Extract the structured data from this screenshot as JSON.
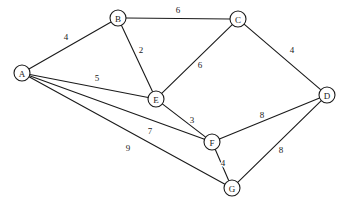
{
  "chart_data": {
    "type": "diagram",
    "title": "",
    "graph_kind": "undirected-weighted-graph",
    "background_color": "#ffffff",
    "stroke_color": "#1a1a1a",
    "node_fill": "#ffffff",
    "node_radius": 8,
    "canvas": {
      "width": 352,
      "height": 212
    },
    "nodes": [
      {
        "id": "A",
        "label": "A",
        "x": 22,
        "y": 73
      },
      {
        "id": "B",
        "label": "B",
        "x": 118,
        "y": 18
      },
      {
        "id": "C",
        "label": "C",
        "x": 238,
        "y": 19
      },
      {
        "id": "D",
        "label": "D",
        "x": 327,
        "y": 95
      },
      {
        "id": "E",
        "label": "E",
        "x": 156,
        "y": 99
      },
      {
        "id": "F",
        "label": "F",
        "x": 212,
        "y": 142
      },
      {
        "id": "G",
        "label": "G",
        "x": 232,
        "y": 188
      }
    ],
    "edges": [
      {
        "source": "A",
        "target": "B",
        "weight": 4,
        "label": "4",
        "label_x": 66,
        "label_y": 37
      },
      {
        "source": "A",
        "target": "E",
        "weight": 5,
        "label": "5",
        "label_x": 97,
        "label_y": 78
      },
      {
        "source": "A",
        "target": "F",
        "weight": 7,
        "label": "7",
        "label_x": 150,
        "label_y": 131
      },
      {
        "source": "A",
        "target": "G",
        "weight": 9,
        "label": "9",
        "label_x": 128,
        "label_y": 148
      },
      {
        "source": "B",
        "target": "C",
        "weight": 6,
        "label": "6",
        "label_x": 178,
        "label_y": 10
      },
      {
        "source": "B",
        "target": "E",
        "weight": 2,
        "label": "2",
        "label_x": 141,
        "label_y": 50
      },
      {
        "source": "C",
        "target": "E",
        "weight": 6,
        "label": "6",
        "label_x": 200,
        "label_y": 65
      },
      {
        "source": "C",
        "target": "D",
        "weight": 4,
        "label": "4",
        "label_x": 292,
        "label_y": 50
      },
      {
        "source": "E",
        "target": "F",
        "weight": 3,
        "label": "3",
        "label_x": 192,
        "label_y": 120
      },
      {
        "source": "F",
        "target": "D",
        "weight": 8,
        "label": "8",
        "label_x": 262,
        "label_y": 115
      },
      {
        "source": "F",
        "target": "G",
        "weight": 4,
        "label": "4",
        "label_x": 223,
        "label_y": 163
      },
      {
        "source": "G",
        "target": "D",
        "weight": 8,
        "label": "8",
        "label_x": 281,
        "label_y": 150
      }
    ],
    "node_ids": [
      "A",
      "B",
      "C",
      "D",
      "E",
      "F",
      "G"
    ],
    "weights": [
      4,
      5,
      7,
      9,
      6,
      2,
      6,
      4,
      3,
      8,
      4,
      8
    ],
    "node_count": 7,
    "edge_count": 12
  }
}
